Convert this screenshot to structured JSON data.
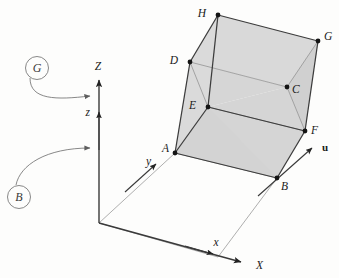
{
  "figure": {
    "background_color": "#fdfdfc",
    "face_fill": "#d4d4d4",
    "face_fill_light": "#dcdcdc",
    "edge_color": "#3c3c3c",
    "thin_line_color": "#8a8a8a",
    "vertex_color": "#141414",
    "callout_color": "#6a6a6a"
  },
  "vertices": [
    {
      "name": "H",
      "label": "H",
      "x": 218,
      "y": 15,
      "label_dx": -12,
      "label_dy": 2
    },
    {
      "name": "G",
      "label": "G",
      "x": 318,
      "y": 41,
      "label_dx": 6,
      "label_dy": -2
    },
    {
      "name": "D",
      "label": "D",
      "x": 190,
      "y": 62,
      "label_dx": -12,
      "label_dy": 2
    },
    {
      "name": "C",
      "label": "C",
      "x": 287,
      "y": 87,
      "label_dx": 5,
      "label_dy": 5
    },
    {
      "name": "E",
      "label": "E",
      "x": 208,
      "y": 107,
      "label_dx": -12,
      "label_dy": 2
    },
    {
      "name": "F",
      "label": "F",
      "x": 305,
      "y": 131,
      "label_dx": 6,
      "label_dy": 2
    },
    {
      "name": "A",
      "label": "A",
      "x": 175,
      "y": 153,
      "label_dx": -12,
      "label_dy": -1
    },
    {
      "name": "B",
      "label": "B",
      "x": 277,
      "y": 178,
      "label_dx": 4,
      "label_dy": 11
    }
  ],
  "axes": {
    "origin": {
      "x": 99,
      "y": 223
    },
    "global": [
      {
        "name": "Z",
        "label": "Z",
        "tip_x": 99,
        "tip_y": 72,
        "label_x": 98,
        "label_y": 66
      },
      {
        "name": "X",
        "label": "X",
        "tip_x": 248,
        "tip_y": 263,
        "label_x": 254,
        "label_y": 267
      }
    ],
    "local": [
      {
        "name": "z",
        "label": "z",
        "tip_x": 99,
        "tip_y": 110,
        "label_x": 89,
        "label_y": 113
      },
      {
        "name": "y",
        "label": "y",
        "tip_x": 161,
        "tip_y": 168,
        "label_x": 150,
        "label_y": 165
      },
      {
        "name": "x",
        "label": "x",
        "tip_x": 218,
        "tip_y": 257,
        "label_x": 214,
        "label_y": 247
      }
    ],
    "vector": {
      "name": "u",
      "label": "u",
      "tail_x": 277,
      "tail_y": 178,
      "tip_x": 316,
      "tip_y": 144,
      "label_x": 322,
      "label_y": 150
    }
  },
  "callouts": [
    {
      "name": "G",
      "label": "G",
      "cx": 37,
      "cy": 68,
      "r": 11,
      "arrow_tip_x": 95,
      "arrow_tip_y": 96
    },
    {
      "name": "B",
      "label": "B",
      "cx": 19,
      "cy": 197,
      "r": 11,
      "arrow_tip_x": 95,
      "arrow_tip_y": 148
    }
  ],
  "faces": {
    "top": "H-G-C-D",
    "left": "D-C-E-A",
    "front": "A-E-F-B",
    "ground": "origin-A-B-x"
  }
}
